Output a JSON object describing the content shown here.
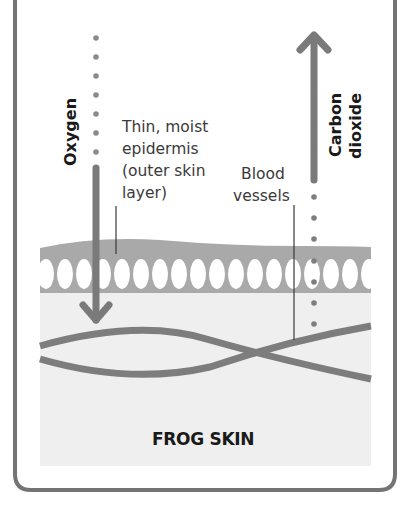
{
  "diagram": {
    "title": "FROG SKIN",
    "labels": {
      "oxygen": "Oxygen",
      "carbon_dioxide_line1": "Carbon",
      "carbon_dioxide_line2": "dioxide",
      "epidermis_line1": "Thin, moist",
      "epidermis_line2": "epidermis",
      "epidermis_line3": "(outer skin",
      "epidermis_line4": "layer)",
      "blood_line1": "Blood",
      "blood_line2": "vessels"
    },
    "arrows": [
      {
        "name": "oxygen",
        "direction": "down",
        "meaning": "oxygen diffuses into skin"
      },
      {
        "name": "carbon-dioxide",
        "direction": "up",
        "meaning": "carbon dioxide diffuses out of skin"
      }
    ],
    "colors": {
      "frame": "#6e6e6e",
      "arrow": "#7a7a7a",
      "epidermis": "#a9a9a9",
      "dermis": "#efefef",
      "vessel": "#7d7d7d",
      "text": "#1a1a1a"
    }
  }
}
